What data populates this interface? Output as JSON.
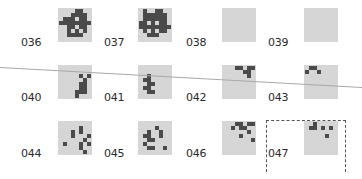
{
  "colors": {
    "tile_bg": "#d6d6d6",
    "pixel": "#4a4a4a",
    "guide_line": "#a8a8a8"
  },
  "tiles": [
    {
      "id": "036",
      "label": "036",
      "x": 58,
      "y": 8,
      "lx": 21,
      "ly": 37,
      "pixels": [
        [
          4,
          0
        ],
        [
          5,
          0
        ],
        [
          3,
          1
        ],
        [
          4,
          1
        ],
        [
          5,
          1
        ],
        [
          6,
          1
        ],
        [
          1,
          2
        ],
        [
          2,
          2
        ],
        [
          3,
          2
        ],
        [
          5,
          2
        ],
        [
          6,
          2
        ],
        [
          0,
          3
        ],
        [
          1,
          3
        ],
        [
          2,
          3
        ],
        [
          3,
          3
        ],
        [
          4,
          3
        ],
        [
          5,
          3
        ],
        [
          6,
          3
        ],
        [
          7,
          3
        ],
        [
          2,
          4
        ],
        [
          3,
          4
        ],
        [
          5,
          4
        ],
        [
          6,
          4
        ],
        [
          2,
          5
        ],
        [
          4,
          5
        ],
        [
          6,
          5
        ],
        [
          2,
          6
        ],
        [
          3,
          6
        ],
        [
          4,
          6
        ],
        [
          5,
          6
        ]
      ]
    },
    {
      "id": "037",
      "label": "037",
      "x": 138,
      "y": 8,
      "lx": 104,
      "ly": 37,
      "pixels": [
        [
          1,
          0
        ],
        [
          4,
          0
        ],
        [
          5,
          0
        ],
        [
          1,
          1
        ],
        [
          2,
          1
        ],
        [
          3,
          1
        ],
        [
          4,
          1
        ],
        [
          5,
          1
        ],
        [
          6,
          1
        ],
        [
          1,
          2
        ],
        [
          2,
          2
        ],
        [
          3,
          2
        ],
        [
          4,
          2
        ],
        [
          5,
          2
        ],
        [
          6,
          2
        ],
        [
          0,
          3
        ],
        [
          1,
          3
        ],
        [
          3,
          3
        ],
        [
          5,
          3
        ],
        [
          6,
          3
        ],
        [
          0,
          4
        ],
        [
          1,
          4
        ],
        [
          2,
          4
        ],
        [
          3,
          4
        ],
        [
          4,
          4
        ],
        [
          5,
          4
        ],
        [
          6,
          4
        ],
        [
          7,
          4
        ],
        [
          1,
          5
        ],
        [
          3,
          5
        ],
        [
          5,
          5
        ],
        [
          6,
          5
        ],
        [
          2,
          6
        ],
        [
          3,
          6
        ],
        [
          4,
          6
        ]
      ]
    },
    {
      "id": "038",
      "label": "038",
      "x": 222,
      "y": 8,
      "lx": 186,
      "ly": 37,
      "pixels": []
    },
    {
      "id": "039",
      "label": "039",
      "x": 304,
      "y": 8,
      "lx": 268,
      "ly": 37,
      "pixels": []
    },
    {
      "id": "040",
      "label": "040",
      "x": 58,
      "y": 65,
      "lx": 21,
      "ly": 92,
      "pixels": [
        [
          5,
          2
        ],
        [
          7,
          2
        ],
        [
          6,
          3
        ],
        [
          5,
          4
        ],
        [
          6,
          4
        ],
        [
          5,
          5
        ],
        [
          6,
          5
        ],
        [
          4,
          6
        ],
        [
          5,
          6
        ],
        [
          6,
          6
        ],
        [
          4,
          7
        ]
      ]
    },
    {
      "id": "041",
      "label": "041",
      "x": 138,
      "y": 65,
      "lx": 104,
      "ly": 92,
      "pixels": [
        [
          2,
          2
        ],
        [
          1,
          3
        ],
        [
          2,
          3
        ],
        [
          2,
          4
        ],
        [
          3,
          4
        ],
        [
          1,
          5
        ],
        [
          2,
          5
        ],
        [
          2,
          6
        ],
        [
          3,
          6
        ]
      ]
    },
    {
      "id": "042",
      "label": "042",
      "x": 222,
      "y": 65,
      "lx": 186,
      "ly": 92,
      "pixels": [
        [
          3,
          0
        ],
        [
          4,
          0
        ],
        [
          6,
          0
        ],
        [
          7,
          0
        ],
        [
          5,
          1
        ],
        [
          6,
          1
        ],
        [
          6,
          2
        ]
      ]
    },
    {
      "id": "043",
      "label": "043",
      "x": 304,
      "y": 65,
      "lx": 268,
      "ly": 92,
      "pixels": [
        [
          1,
          0
        ],
        [
          2,
          0
        ],
        [
          0,
          1
        ],
        [
          3,
          1
        ]
      ]
    },
    {
      "id": "044",
      "label": "044",
      "x": 58,
      "y": 121,
      "lx": 21,
      "ly": 148,
      "pixels": [
        [
          5,
          1
        ],
        [
          3,
          2
        ],
        [
          5,
          2
        ],
        [
          3,
          3
        ],
        [
          7,
          3
        ],
        [
          6,
          4
        ],
        [
          1,
          5
        ],
        [
          5,
          5
        ],
        [
          7,
          5
        ],
        [
          5,
          6
        ],
        [
          6,
          7
        ]
      ]
    },
    {
      "id": "045",
      "label": "045",
      "x": 138,
      "y": 121,
      "lx": 104,
      "ly": 148,
      "pixels": [
        [
          4,
          1
        ],
        [
          2,
          2
        ],
        [
          5,
          2
        ],
        [
          1,
          3
        ],
        [
          2,
          3
        ],
        [
          5,
          3
        ],
        [
          2,
          4
        ],
        [
          3,
          4
        ],
        [
          1,
          5
        ],
        [
          2,
          6
        ],
        [
          3,
          6
        ],
        [
          6,
          6
        ]
      ]
    },
    {
      "id": "046",
      "label": "046",
      "x": 222,
      "y": 121,
      "lx": 186,
      "ly": 148,
      "pixels": [
        [
          3,
          0
        ],
        [
          4,
          0
        ],
        [
          6,
          0
        ],
        [
          7,
          0
        ],
        [
          2,
          1
        ],
        [
          4,
          1
        ],
        [
          5,
          1
        ],
        [
          6,
          2
        ],
        [
          4,
          3
        ],
        [
          7,
          4
        ]
      ]
    },
    {
      "id": "047",
      "label": "047",
      "x": 304,
      "y": 121,
      "lx": 268,
      "ly": 148,
      "pixels": [
        [
          2,
          0
        ],
        [
          1,
          1
        ],
        [
          2,
          1
        ],
        [
          4,
          1
        ],
        [
          6,
          1
        ],
        [
          5,
          3
        ]
      ]
    }
  ]
}
